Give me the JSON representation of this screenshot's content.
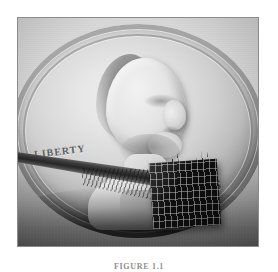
{
  "figure": {
    "caption": "FIGURE 1.1",
    "alt": "photograph-of-microneedle-array-chip-on-us-penny"
  },
  "photo": {
    "subject": "us-lincoln-penny",
    "coin": {
      "motto": "IN GOD WE TRUST",
      "liberty": "LIBERTY",
      "date": "65"
    },
    "chip": {
      "label": "microneedle-array",
      "grid_columns": 10,
      "grid_rows": 8
    },
    "probe": {
      "label": "probe-rod"
    }
  },
  "colors": {
    "page_background": "#ffffff",
    "frame_border": "#8b8b8b",
    "coin_light": "#efefef",
    "coin_mid": "#cfcfcf",
    "coin_dark": "#8e8e8e",
    "chip_body": "#0e0e0e",
    "caption_text": "#8e8e8e"
  }
}
